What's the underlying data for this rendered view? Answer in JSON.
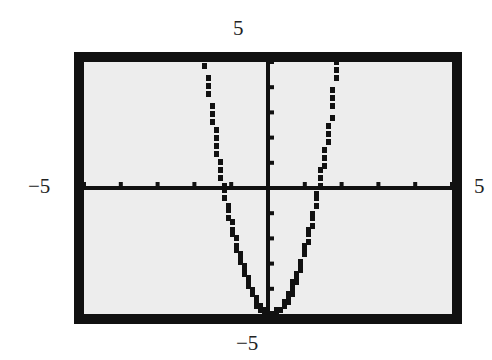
{
  "chart_data": {
    "type": "line",
    "title": "",
    "xlabel": "",
    "ylabel": "",
    "xlim": [
      -5,
      5
    ],
    "ylim": [
      -5,
      5
    ],
    "xscale_ticks": 1,
    "yscale_ticks": 1,
    "grid": false,
    "window_labels": {
      "ymax": "5",
      "ymin": "−5",
      "xmin": "−5",
      "xmax": "5"
    },
    "series": [
      {
        "name": "y = 3x² − 5 (approx.)",
        "x": [
          -1.8,
          -1.5,
          -1.25,
          -1.0,
          -0.5,
          0,
          0.5,
          1.0,
          1.3,
          1.5,
          1.9
        ],
        "y": [
          4.7,
          1.75,
          -0.3,
          -2.0,
          -4.25,
          -5.0,
          -4.25,
          -2.0,
          0.0,
          1.75,
          5.0
        ]
      }
    ],
    "colors": {
      "frame": "#111111",
      "screen": "#ededed",
      "curve": "#111111"
    }
  }
}
